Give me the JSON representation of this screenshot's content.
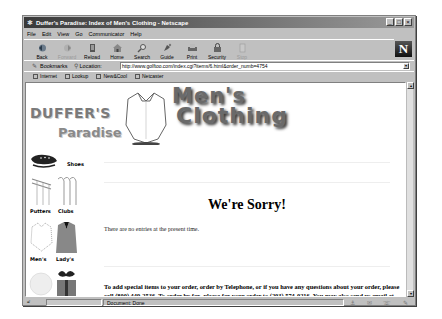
{
  "window": {
    "title": "Duffer's Paradise: Index of Men's Clothing - Netscape",
    "controls": [
      "_",
      "□",
      "×"
    ]
  },
  "menu": [
    "File",
    "Edit",
    "View",
    "Go",
    "Communicator",
    "Help"
  ],
  "toolbar": {
    "buttons": [
      {
        "label": "Back",
        "icon": "back-arrow-icon",
        "enabled": true
      },
      {
        "label": "Forward",
        "icon": "forward-arrow-icon",
        "enabled": false
      },
      {
        "label": "Reload",
        "icon": "reload-icon",
        "enabled": true
      },
      {
        "label": "Home",
        "icon": "home-icon",
        "enabled": true
      },
      {
        "label": "Search",
        "icon": "search-icon",
        "enabled": true
      },
      {
        "label": "Guide",
        "icon": "guide-icon",
        "enabled": true
      },
      {
        "label": "Print",
        "icon": "print-icon",
        "enabled": true
      },
      {
        "label": "Security",
        "icon": "security-icon",
        "enabled": true
      },
      {
        "label": "Stop",
        "icon": "stop-icon",
        "enabled": false
      }
    ],
    "logo": "N"
  },
  "location_bar": {
    "bookmarks_label": "Bookmarks",
    "location_label": "Location:",
    "url": "http://www.golftoo.com/index.cgi?items/6.html&order_numb=4754"
  },
  "personal_toolbar": [
    "Internet",
    "Lookup",
    "New&Cool",
    "Netcaster"
  ],
  "page": {
    "logo_line1": "DUFFER'S",
    "logo_line2": "Paradise",
    "banner_line1": "Men's",
    "banner_line2": "Clothing",
    "sidebar": [
      {
        "label": "Shoes"
      },
      {
        "label": "Putters"
      },
      {
        "label": "Clubs"
      },
      {
        "label": "Men's"
      },
      {
        "label": "Lady's"
      }
    ],
    "heading": "We're Sorry!",
    "message": "There are no entries at the present time.",
    "paragraph": "To add special items to your order, order by Telephone, or if you have any questions about your order, please call (800) 449-2536. To order by fax, please fax your order to (203) 574-0216. You may also send us email at"
  },
  "status": {
    "text": "Document: Done"
  }
}
